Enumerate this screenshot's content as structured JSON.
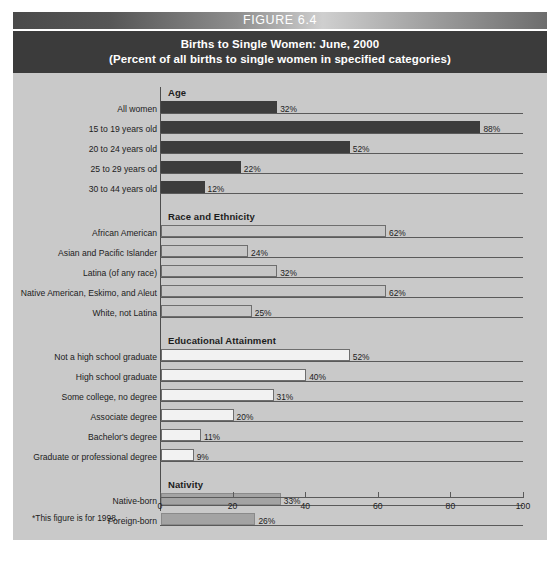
{
  "figure": {
    "banner_label": "FIGURE 6.4",
    "title_line1": "Births to Single Women: June, 2000",
    "title_line2": "(Percent of all births to single women in specified categories)",
    "footnote": "*This figure is for 1998."
  },
  "colors": {
    "background": "#c9c9c9",
    "title_block": "#3b3b3b",
    "bar_dark": "#3d3d3d",
    "bar_light": "#c6c6c6",
    "bar_white": "#f2f2f2",
    "bar_medium": "#a3a3a3",
    "axis": "#5a5a5a",
    "text": "#1c1c1c"
  },
  "chart_data": {
    "type": "bar",
    "orientation": "horizontal",
    "title": "Births to Single Women: June, 2000",
    "subtitle": "(Percent of all births to single women in specified categories)",
    "xlabel": "",
    "ylabel": "",
    "xlim": [
      0,
      100
    ],
    "xticks": [
      0,
      20,
      40,
      60,
      80,
      100
    ],
    "xtick_labels": [
      "0",
      "20",
      "40",
      "60",
      "80",
      "100"
    ],
    "grid": false,
    "legend": false,
    "value_suffix": "%",
    "groups": [
      {
        "name": "Age",
        "style": "dark",
        "categories": [
          "All women",
          "15 to 19 years old",
          "20 to 24 years old",
          "25 to 29 years od",
          "30 to 44 years old"
        ],
        "values": [
          32,
          88,
          52,
          22,
          12
        ],
        "labels": [
          "32%",
          "88%",
          "52%",
          "22%",
          "12%"
        ]
      },
      {
        "name": "Race and Ethnicity",
        "style": "light",
        "categories": [
          "African American",
          "Asian and Pacific Islander",
          "Latina (of any race)",
          "Native American, Eskimo, and Aleut",
          "White, not Latina"
        ],
        "values": [
          62,
          24,
          32,
          62,
          25
        ],
        "labels": [
          "62%",
          "24%",
          "32%",
          "62%",
          "25%"
        ]
      },
      {
        "name": "Educational Attainment",
        "style": "white",
        "categories": [
          "Not a high school graduate",
          "High school graduate",
          "Some college, no degree",
          "Associate degree",
          "Bachelor's degree",
          "Graduate or professional degree"
        ],
        "values": [
          52,
          40,
          31,
          20,
          11,
          9
        ],
        "labels": [
          "52%",
          "40%",
          "31%",
          "20%",
          "11%",
          "9%"
        ]
      },
      {
        "name": "Nativity",
        "style": "medium",
        "categories": [
          "Native-born",
          "Foreign-born"
        ],
        "values": [
          33,
          26
        ],
        "labels": [
          "33%",
          "26%"
        ]
      }
    ]
  }
}
